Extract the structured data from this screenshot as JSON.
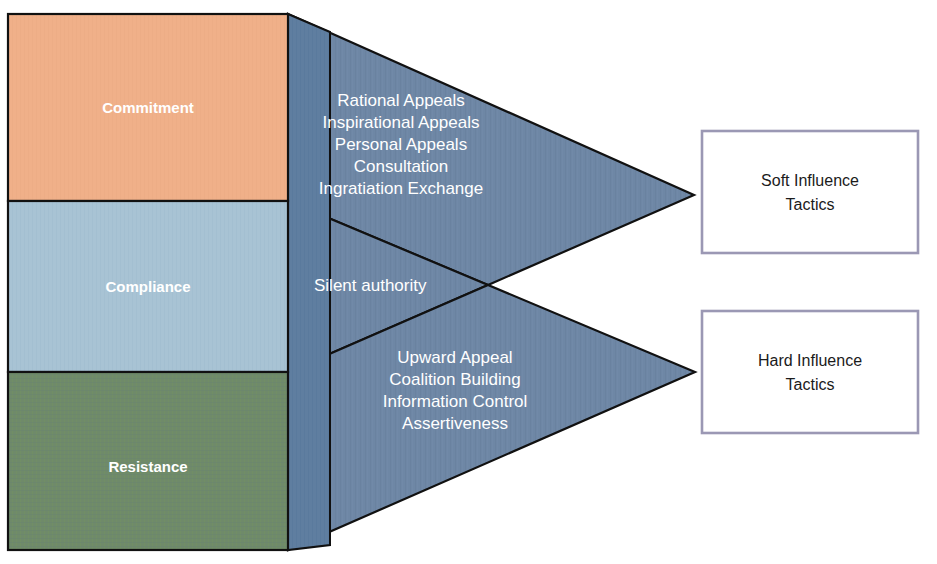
{
  "diagram": {
    "colors": {
      "commitment_fill": "#f0b089",
      "compliance_fill": "#a8c3d4",
      "resistance_fill": "#6f8a6a",
      "arrow_fill": "#6e87a5",
      "side_face_fill": "#5f7ea0",
      "outline": "#111111",
      "box_border": "#9b98b4",
      "box_fill": "#ffffff",
      "label_text": "#ffffff",
      "box_text": "#1b1b1b",
      "background": "#ffffff"
    },
    "outcomes": [
      {
        "id": "commitment",
        "label": "Commitment",
        "fill": "#f0b089"
      },
      {
        "id": "compliance",
        "label": "Compliance",
        "fill": "#a8c3d4"
      },
      {
        "id": "resistance",
        "label": "Resistance",
        "fill": "#6f8a6a"
      }
    ],
    "arrows": [
      {
        "id": "soft-arrow",
        "target": "Soft Influence Tactics",
        "tactics": [
          "Rational Appeals",
          "Inspirational Appeals",
          "Personal Appeals",
          "Consultation",
          "Ingratiation Exchange"
        ]
      },
      {
        "id": "middle-arrow",
        "target": "",
        "tactics": [
          "Silent authority"
        ]
      },
      {
        "id": "hard-arrow",
        "target": "Hard Influence Tactics",
        "tactics": [
          "Upward Appeal",
          "Coalition Building",
          "Information Control",
          "Assertiveness"
        ]
      }
    ],
    "boxes": [
      {
        "id": "soft-influence-box",
        "line1": "Soft Influence",
        "line2": "Tactics"
      },
      {
        "id": "hard-influence-box",
        "line1": "Hard Influence",
        "line2": "Tactics"
      }
    ]
  }
}
